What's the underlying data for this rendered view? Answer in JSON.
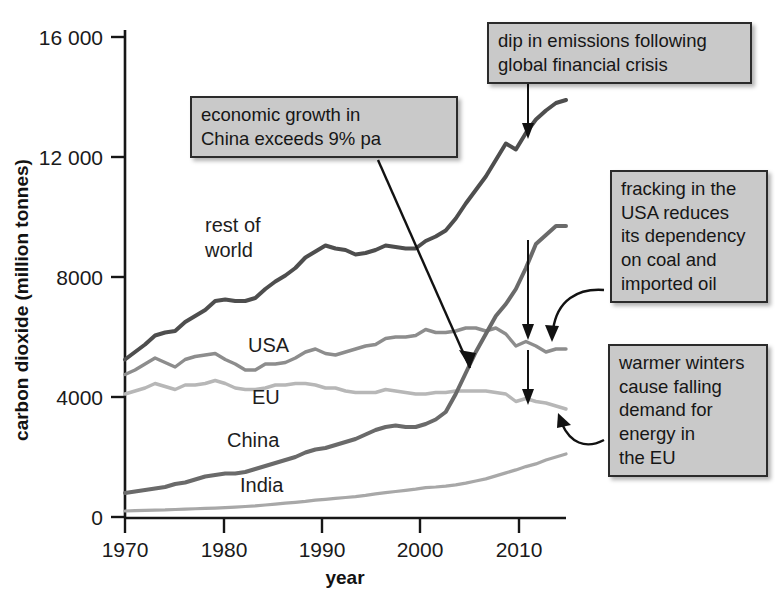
{
  "chart_data": {
    "type": "line",
    "title": "",
    "xlabel": "year",
    "ylabel": "carbon dioxide (million tonnes)",
    "xlim": [
      1970,
      2014
    ],
    "ylim": [
      0,
      16000
    ],
    "xticks": [
      "1970",
      "1980",
      "1990",
      "2000",
      "2010"
    ],
    "yticks": [
      "0",
      "4000",
      "8000",
      "12 000",
      "16 000"
    ],
    "grid": false,
    "legend": "inline-labels",
    "x": [
      1970,
      1971,
      1972,
      1973,
      1974,
      1975,
      1976,
      1977,
      1978,
      1979,
      1980,
      1981,
      1982,
      1983,
      1984,
      1985,
      1986,
      1987,
      1988,
      1989,
      1990,
      1991,
      1992,
      1993,
      1994,
      1995,
      1996,
      1997,
      1998,
      1999,
      2000,
      2001,
      2002,
      2003,
      2004,
      2005,
      2006,
      2007,
      2008,
      2009,
      2010,
      2011,
      2012,
      2013,
      2014
    ],
    "series": [
      {
        "name": "rest of world",
        "color": "#4e4e4e",
        "width": 4.0,
        "values": [
          5250,
          5500,
          5750,
          6050,
          6150,
          6200,
          6500,
          6700,
          6900,
          7200,
          7250,
          7200,
          7200,
          7300,
          7600,
          7850,
          8050,
          8300,
          8650,
          8850,
          9050,
          8950,
          8900,
          8750,
          8800,
          8900,
          9050,
          9000,
          8950,
          8950,
          9200,
          9350,
          9550,
          9950,
          10450,
          10900,
          11350,
          11900,
          12450,
          12250,
          12800,
          13250,
          13550,
          13800,
          13900
        ]
      },
      {
        "name": "USA",
        "color": "#8d8d8d",
        "width": 3.4,
        "values": [
          4750,
          4900,
          5100,
          5300,
          5150,
          5000,
          5250,
          5350,
          5400,
          5450,
          5250,
          5100,
          4900,
          4900,
          5100,
          5100,
          5150,
          5300,
          5500,
          5600,
          5450,
          5400,
          5500,
          5600,
          5700,
          5750,
          5950,
          6000,
          6000,
          6050,
          6250,
          6150,
          6150,
          6200,
          6300,
          6300,
          6200,
          6300,
          6100,
          5700,
          5850,
          5700,
          5500,
          5600,
          5600
        ]
      },
      {
        "name": "EU",
        "color": "#b7b7b7",
        "width": 3.4,
        "values": [
          4100,
          4200,
          4300,
          4450,
          4350,
          4250,
          4400,
          4400,
          4450,
          4550,
          4450,
          4300,
          4250,
          4250,
          4300,
          4400,
          4400,
          4450,
          4450,
          4400,
          4300,
          4300,
          4200,
          4150,
          4150,
          4150,
          4250,
          4200,
          4150,
          4100,
          4100,
          4150,
          4150,
          4200,
          4200,
          4200,
          4200,
          4150,
          4100,
          3850,
          3950,
          3850,
          3800,
          3700,
          3600
        ]
      },
      {
        "name": "China",
        "color": "#6a6a6a",
        "width": 4.0,
        "values": [
          800,
          850,
          900,
          950,
          1000,
          1100,
          1150,
          1250,
          1350,
          1400,
          1450,
          1450,
          1500,
          1600,
          1700,
          1800,
          1900,
          2000,
          2150,
          2250,
          2300,
          2400,
          2500,
          2600,
          2750,
          2900,
          3000,
          3050,
          3000,
          3000,
          3100,
          3250,
          3500,
          4100,
          4800,
          5500,
          6100,
          6700,
          7100,
          7600,
          8300,
          9100,
          9400,
          9700,
          9700
        ]
      },
      {
        "name": "India",
        "color": "#a8a8a8",
        "width": 3.2,
        "values": [
          200,
          210,
          220,
          230,
          235,
          250,
          260,
          275,
          285,
          295,
          310,
          330,
          350,
          370,
          400,
          430,
          460,
          490,
          520,
          560,
          590,
          620,
          650,
          680,
          720,
          770,
          810,
          850,
          890,
          930,
          980,
          1000,
          1030,
          1070,
          1130,
          1200,
          1270,
          1370,
          1470,
          1570,
          1680,
          1770,
          1900,
          2000,
          2100
        ]
      }
    ],
    "series_label_positions": [
      {
        "name": "rest of world",
        "x": 205,
        "y": 232
      },
      {
        "name": "USA",
        "x": 248,
        "y": 352
      },
      {
        "name": "EU",
        "x": 252,
        "y": 404
      },
      {
        "name": "China",
        "x": 227,
        "y": 447
      },
      {
        "name": "India",
        "x": 240,
        "y": 492
      }
    ],
    "annotations": [
      {
        "id": "china-growth",
        "text": "economic growth in\nChina exceeds 9% pa",
        "points_to": "China line around 2003"
      },
      {
        "id": "financial-crisis",
        "text": "dip in emissions following\nglobal financial crisis",
        "points_to": "dips in rest of world, USA and EU lines around 2009"
      },
      {
        "id": "usa-fracking",
        "text": "fracking in the\nUSA reduces\nits dependency\non coal and\nimported oil",
        "points_to": "USA line after 2009"
      },
      {
        "id": "eu-warm-winters",
        "text": "warmer winters\ncause falling\ndemand for\nenergy in\nthe EU",
        "points_to": "EU line after 2010"
      }
    ]
  }
}
